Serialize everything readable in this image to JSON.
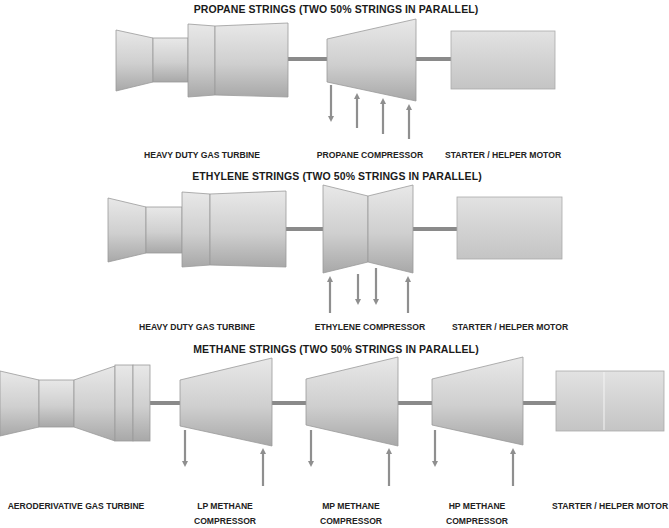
{
  "diagram": {
    "colors": {
      "body_light": "#e6e6e6",
      "body_dark": "#a9a9a9",
      "outline": "#9a9a9a",
      "shaft": "#8a8a8a",
      "arrow": "#8f8f8f",
      "text": "#1a1a1a"
    },
    "sections": [
      {
        "id": "propane",
        "title": "PROPANE STRINGS (TWO 50% STRINGS IN PARALLEL)",
        "components": [
          {
            "type": "heavy-duty-gas-turbine",
            "label": "HEAVY DUTY GAS TURBINE"
          },
          {
            "type": "compressor",
            "label": "PROPANE COMPRESSOR",
            "arrows": [
              {
                "direction": "down",
                "role": "discharge"
              },
              {
                "direction": "up",
                "role": "suction"
              },
              {
                "direction": "up",
                "role": "suction"
              },
              {
                "direction": "up",
                "role": "suction"
              }
            ]
          },
          {
            "type": "motor",
            "label": "STARTER / HELPER MOTOR"
          }
        ]
      },
      {
        "id": "ethylene",
        "title": "ETHYLENE STRINGS (TWO 50% STRINGS IN PARALLEL)",
        "components": [
          {
            "type": "heavy-duty-gas-turbine",
            "label": "HEAVY DUTY GAS TURBINE"
          },
          {
            "type": "compressor",
            "label": "ETHYLENE COMPRESSOR",
            "arrows": [
              {
                "direction": "up",
                "role": "suction"
              },
              {
                "direction": "down",
                "role": "discharge"
              },
              {
                "direction": "down",
                "role": "discharge"
              },
              {
                "direction": "up",
                "role": "suction"
              }
            ]
          },
          {
            "type": "motor",
            "label": "STARTER / HELPER MOTOR"
          }
        ]
      },
      {
        "id": "methane",
        "title": "METHANE STRINGS (TWO 50% STRINGS IN PARALLEL)",
        "components": [
          {
            "type": "aeroderivative-gas-turbine",
            "label": "AERODERIVATIVE GAS TURBINE"
          },
          {
            "type": "compressor",
            "label_line1": "LP METHANE",
            "label_line2": "COMPRESSOR",
            "arrows": [
              {
                "direction": "down",
                "role": "discharge"
              },
              {
                "direction": "up",
                "role": "suction"
              }
            ]
          },
          {
            "type": "compressor",
            "label_line1": "MP METHANE",
            "label_line2": "COMPRESSOR",
            "arrows": [
              {
                "direction": "down",
                "role": "discharge"
              },
              {
                "direction": "up",
                "role": "suction"
              }
            ]
          },
          {
            "type": "compressor",
            "label_line1": "HP METHANE",
            "label_line2": "COMPRESSOR",
            "arrows": [
              {
                "direction": "down",
                "role": "discharge"
              },
              {
                "direction": "up",
                "role": "suction"
              }
            ]
          },
          {
            "type": "motor",
            "label": "STARTER / HELPER MOTOR"
          }
        ]
      }
    ]
  }
}
